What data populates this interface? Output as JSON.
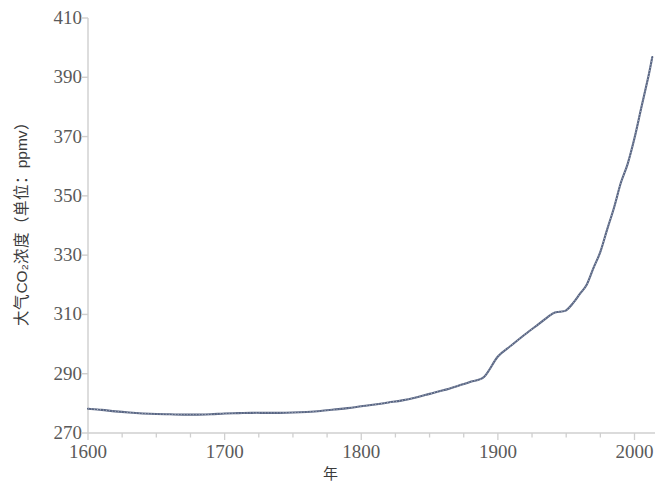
{
  "chart_data": {
    "type": "line",
    "title": "",
    "xlabel": "年",
    "ylabel": "大气CO₂浓度（单位：ppmv）",
    "xlim": [
      1600,
      2015
    ],
    "ylim": [
      270,
      410
    ],
    "xticks": [
      1600,
      1700,
      1800,
      1900,
      2000
    ],
    "xtick_labels": [
      "1600",
      "1700",
      "1800",
      "1900",
      "2000"
    ],
    "x_minor_tick_step": 25,
    "yticks": [
      270,
      290,
      310,
      330,
      350,
      370,
      390,
      410
    ],
    "ytick_labels": [
      "270",
      "290",
      "310",
      "330",
      "350",
      "370",
      "390",
      "410"
    ],
    "grid": false,
    "legend": false,
    "legend_position": "none",
    "line_color": "#4a5878",
    "axis_color": "#cfcfcf",
    "tick_label_color": "#5a5a5a",
    "background_color": "#ffffff",
    "series": [
      {
        "name": "大气CO₂浓度",
        "x": [
          1600,
          1610,
          1620,
          1630,
          1640,
          1650,
          1660,
          1670,
          1680,
          1690,
          1700,
          1710,
          1720,
          1730,
          1740,
          1750,
          1760,
          1770,
          1780,
          1790,
          1800,
          1810,
          1820,
          1830,
          1840,
          1850,
          1860,
          1870,
          1880,
          1890,
          1900,
          1910,
          1920,
          1930,
          1940,
          1945,
          1950,
          1955,
          1960,
          1965,
          1970,
          1975,
          1980,
          1985,
          1990,
          1995,
          2000,
          2005,
          2010,
          2013
        ],
        "values": [
          278.2,
          277.8,
          277.3,
          276.9,
          276.6,
          276.4,
          276.3,
          276.2,
          276.2,
          276.3,
          276.6,
          276.7,
          276.8,
          276.8,
          276.8,
          276.9,
          277.1,
          277.4,
          277.9,
          278.4,
          279.0,
          279.6,
          280.3,
          281.0,
          282.0,
          283.2,
          284.4,
          285.8,
          287.3,
          289.0,
          295.8,
          299.6,
          303.3,
          306.8,
          310.3,
          310.9,
          311.4,
          313.8,
          316.9,
          320.0,
          325.7,
          331.1,
          338.7,
          346.0,
          354.4,
          360.8,
          369.5,
          379.8,
          389.9,
          396.8
        ]
      }
    ],
    "annotations": []
  },
  "axis": {
    "ylabel": "大气CO₂浓度（单位：ppmv）",
    "xlabel": "年"
  }
}
